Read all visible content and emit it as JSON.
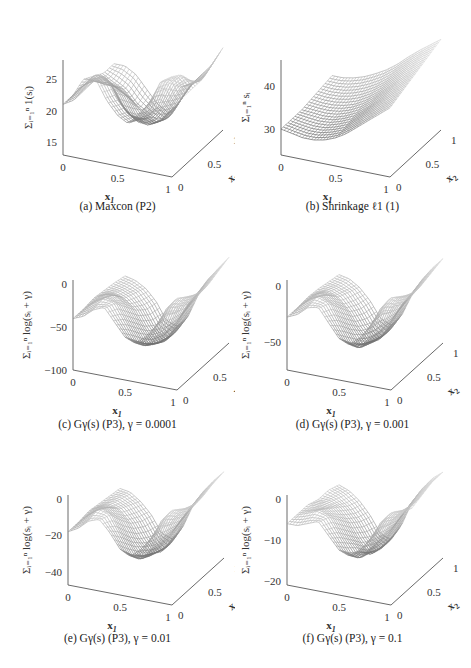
{
  "figure": {
    "panels_layout": "3 rows x 2 columns"
  },
  "chart_data": [
    {
      "id": "a",
      "type": "surface3d",
      "caption": "(a) Maxcon (P2)",
      "xlabel": "x1",
      "ylabel": "x2",
      "zlabel": "Σ_{i=1}^{n} 1(s_i)",
      "x_ticks": [
        "0",
        "0.5",
        "1"
      ],
      "y_ticks": [
        "0",
        "0.5",
        "1"
      ],
      "z_ticks": [
        "15",
        "20",
        "25"
      ],
      "zlim": [
        13,
        28
      ],
      "xlim": [
        0,
        1
      ],
      "ylim": [
        0,
        1
      ],
      "grid_z": [
        [
          21,
          22,
          24,
          26,
          23,
          21,
          20,
          22,
          24,
          25,
          23
        ],
        [
          21,
          23,
          25,
          25,
          22,
          20,
          19,
          21,
          26,
          27,
          24
        ],
        [
          22,
          22,
          23,
          21,
          18,
          17,
          18,
          20,
          24,
          26,
          24
        ],
        [
          21,
          20,
          20,
          19,
          16,
          15,
          16,
          19,
          22,
          23,
          24
        ],
        [
          20,
          19,
          18,
          16,
          15,
          14,
          15,
          18,
          21,
          22,
          25
        ],
        [
          20,
          20,
          19,
          17,
          15,
          14,
          16,
          19,
          21,
          23,
          26
        ]
      ]
    },
    {
      "id": "b",
      "type": "surface3d",
      "caption": "(b) Shrinkage ℓ1 (1)",
      "xlabel": "x1",
      "ylabel": "x2",
      "zlabel": "Σ_{i=1}^{n} s_i",
      "x_ticks": [
        "0",
        "0.5",
        "1"
      ],
      "y_ticks": [
        "0",
        "0.5",
        "1"
      ],
      "z_ticks": [
        "30",
        "40"
      ],
      "zlim": [
        24,
        46
      ],
      "xlim": [
        0,
        1
      ],
      "ylim": [
        0,
        1
      ],
      "grid_z": [
        [
          30,
          29.5,
          29,
          29,
          29.5,
          30.5,
          32,
          34,
          36,
          38,
          40
        ],
        [
          30,
          29.5,
          29.2,
          29.3,
          30,
          31,
          33,
          35,
          37,
          39,
          41
        ],
        [
          30,
          29.8,
          29.6,
          29.8,
          30.6,
          31.8,
          33.6,
          35.8,
          38,
          40,
          42
        ],
        [
          30.5,
          30.2,
          30.2,
          30.6,
          31.4,
          32.8,
          34.6,
          36.8,
          39,
          41,
          43
        ],
        [
          31,
          30.8,
          31,
          31.6,
          32.6,
          34,
          35.8,
          38,
          40.2,
          42.2,
          44
        ],
        [
          31.5,
          31.5,
          32,
          32.8,
          34,
          35.4,
          37.2,
          39.4,
          41.4,
          43.2,
          45
        ]
      ]
    },
    {
      "id": "c",
      "type": "surface3d",
      "caption": "(c) Gγ(s) (P3), γ = 0.0001",
      "xlabel": "x1",
      "ylabel": "x2",
      "zlabel": "Σ_{i=1}^{n} log(s_i + γ)",
      "x_ticks": [
        "0",
        "0.5",
        "1"
      ],
      "y_ticks": [
        "0",
        "0.5",
        "1"
      ],
      "z_ticks": [
        "−100",
        "−50",
        "0"
      ],
      "zlim": [
        -100,
        5
      ],
      "xlim": [
        0,
        1
      ],
      "ylim": [
        0,
        1
      ],
      "grid_z": [
        [
          -40,
          -35,
          -25,
          -20,
          -35,
          -50,
          -55,
          -45,
          -30,
          -15,
          -10
        ],
        [
          -40,
          -30,
          -22,
          -25,
          -45,
          -65,
          -70,
          -55,
          -20,
          -5,
          -10
        ],
        [
          -38,
          -32,
          -30,
          -40,
          -60,
          -80,
          -78,
          -60,
          -30,
          -15,
          -12
        ],
        [
          -40,
          -40,
          -45,
          -55,
          -75,
          -90,
          -85,
          -60,
          -38,
          -25,
          -10
        ],
        [
          -42,
          -45,
          -50,
          -65,
          -85,
          -95,
          -85,
          -55,
          -35,
          -20,
          -5
        ],
        [
          -45,
          -48,
          -55,
          -68,
          -88,
          -92,
          -80,
          -52,
          -30,
          -15,
          0
        ]
      ]
    },
    {
      "id": "d",
      "type": "surface3d",
      "caption": "(d) Gγ(s) (P3), γ = 0.001",
      "xlabel": "x1",
      "ylabel": "x2",
      "zlabel": "Σ_{i=1}^{n} log(s_i + γ)",
      "x_ticks": [
        "0",
        "0.5",
        "1"
      ],
      "y_ticks": [
        "0",
        "0.5",
        "1"
      ],
      "z_ticks": [
        "−50",
        "0"
      ],
      "zlim": [
        -75,
        5
      ],
      "xlim": [
        0,
        1
      ],
      "ylim": [
        0,
        1
      ],
      "grid_z": [
        [
          -28,
          -24,
          -16,
          -14,
          -26,
          -38,
          -42,
          -34,
          -22,
          -10,
          -6
        ],
        [
          -28,
          -20,
          -14,
          -18,
          -34,
          -50,
          -54,
          -42,
          -14,
          -2,
          -6
        ],
        [
          -27,
          -22,
          -22,
          -30,
          -46,
          -60,
          -58,
          -44,
          -22,
          -10,
          -8
        ],
        [
          -28,
          -28,
          -32,
          -42,
          -56,
          -66,
          -62,
          -44,
          -28,
          -18,
          -6
        ],
        [
          -30,
          -32,
          -36,
          -48,
          -62,
          -70,
          -62,
          -40,
          -26,
          -14,
          -3
        ],
        [
          -32,
          -34,
          -40,
          -50,
          -64,
          -68,
          -58,
          -38,
          -22,
          -10,
          0
        ]
      ]
    },
    {
      "id": "e",
      "type": "surface3d",
      "caption": "(e) Gγ(s) (P3), γ = 0.01",
      "xlabel": "x1",
      "ylabel": "x2",
      "zlabel": "Σ_{i=1}^{n} log(s_i + γ)",
      "x_ticks": [
        "0",
        "0.5",
        "1"
      ],
      "y_ticks": [
        "0",
        "0.5",
        "1"
      ],
      "z_ticks": [
        "−40",
        "−20",
        "0"
      ],
      "zlim": [
        -47,
        2
      ],
      "xlim": [
        0,
        1
      ],
      "ylim": [
        0,
        1
      ],
      "grid_z": [
        [
          -18,
          -15,
          -10,
          -8,
          -14,
          -22,
          -25,
          -20,
          -13,
          -6,
          -3
        ],
        [
          -18,
          -13,
          -8,
          -10,
          -20,
          -30,
          -32,
          -25,
          -8,
          -1,
          -3
        ],
        [
          -17,
          -14,
          -13,
          -18,
          -28,
          -36,
          -35,
          -26,
          -13,
          -6,
          -4
        ],
        [
          -18,
          -17,
          -19,
          -25,
          -34,
          -40,
          -37,
          -26,
          -17,
          -10,
          -3
        ],
        [
          -19,
          -19,
          -22,
          -29,
          -38,
          -44,
          -38,
          -24,
          -15,
          -8,
          -1
        ],
        [
          -20,
          -21,
          -25,
          -31,
          -40,
          -42,
          -35,
          -22,
          -13,
          -6,
          0
        ]
      ]
    },
    {
      "id": "f",
      "type": "surface3d",
      "caption": "(f) Gγ(s) (P3), γ = 0.1",
      "xlabel": "x1",
      "ylabel": "x2",
      "zlabel": "Σ_{i=1}^{n} log(s_i + γ)",
      "x_ticks": [
        "0",
        "0.5",
        "1"
      ],
      "y_ticks": [
        "0",
        "0.5",
        "1"
      ],
      "z_ticks": [
        "−20",
        "−10",
        "0"
      ],
      "zlim": [
        -21,
        1
      ],
      "xlim": [
        0,
        1
      ],
      "ylim": [
        0,
        1
      ],
      "grid_z": [
        [
          -6,
          -6,
          -5,
          -4,
          -7,
          -10,
          -11,
          -9,
          -6,
          -3,
          -1
        ],
        [
          -6,
          -5,
          -4,
          -5,
          -9,
          -13,
          -14,
          -11,
          -4,
          -1,
          -1
        ],
        [
          -6,
          -6,
          -6,
          -8,
          -12,
          -15,
          -15,
          -11,
          -6,
          -3,
          -2
        ],
        [
          -7,
          -7,
          -8,
          -11,
          -15,
          -18,
          -16,
          -11,
          -7,
          -4,
          -1
        ],
        [
          -7,
          -8,
          -10,
          -13,
          -17,
          -19,
          -16,
          -10,
          -6,
          -3,
          0
        ],
        [
          -8,
          -9,
          -11,
          -14,
          -18,
          -19,
          -15,
          -9,
          -5,
          -2,
          0
        ]
      ]
    }
  ]
}
